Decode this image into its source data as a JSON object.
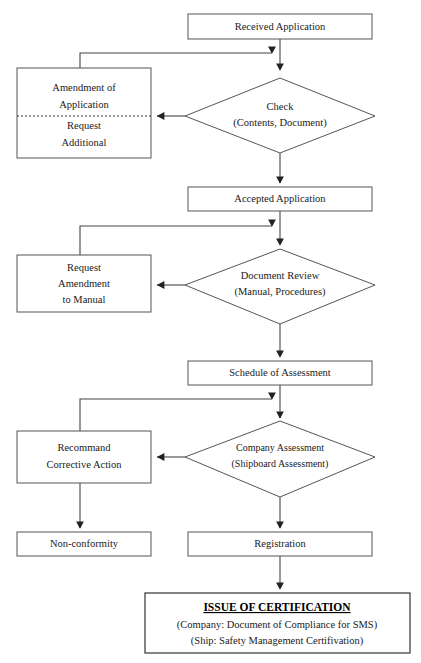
{
  "diagram": {
    "background_color": "#ffffff",
    "line_color": "#444444",
    "box_stroke_color": "#555555",
    "text_color": "#1a1a1a",
    "width": 421,
    "height": 663
  },
  "nodes": {
    "received_application": {
      "label": "Received Application",
      "shape": "rectangle"
    },
    "amendment_box": {
      "line1": "Amendment of",
      "line2": "Application",
      "line3": "Request",
      "line4": "Additional",
      "shape": "rectangle-split-dashed"
    },
    "check_decision": {
      "line1": "Check",
      "line2": "(Contents, Document)",
      "shape": "diamond"
    },
    "accepted_application": {
      "label": "Accepted Application",
      "shape": "rectangle"
    },
    "request_amendment_manual": {
      "line1": "Request",
      "line2": "Amendment",
      "line3": "to Manual",
      "shape": "rectangle"
    },
    "document_review": {
      "line1": "Document Review",
      "line2": "(Manual, Procedures)",
      "shape": "diamond"
    },
    "schedule_assessment": {
      "label": "Schedule of Assessment",
      "shape": "rectangle"
    },
    "recommend_corrective": {
      "line1": "Recommand",
      "line2": "Corrective Action",
      "shape": "rectangle"
    },
    "company_assessment": {
      "line1": "Company Assessment",
      "line2": "(Shipboard Assessment)",
      "shape": "diamond"
    },
    "non_conformity": {
      "label": "Non-conformity",
      "shape": "rectangle"
    },
    "registration": {
      "label": "Registration",
      "shape": "rectangle"
    },
    "issue_certification": {
      "title": "ISSUE OF CERTIFICATION",
      "line1": "(Company: Document of Compliance for SMS)",
      "line2": "(Ship: Safety Management Certifivation)",
      "shape": "rectangle"
    }
  }
}
